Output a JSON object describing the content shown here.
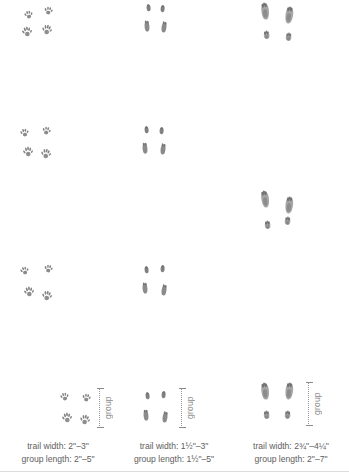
{
  "page": {
    "background_color": "#ffffff",
    "text_color": "#5e5e60",
    "print_color": "#6e6e70"
  },
  "columns": [
    {
      "id": "squirrel",
      "group_label": "group",
      "caption": {
        "trail_width": "trail width: 2\"–3\"",
        "group_length": "group length: 2\"–5\""
      },
      "groups": [
        {
          "prints": [
            {
              "x": 24,
              "y": 10,
              "kind": "small-front",
              "rot": -12,
              "scale": 1.0
            },
            {
              "x": 44,
              "y": 6,
              "kind": "small-front",
              "rot": 10,
              "scale": 1.0
            },
            {
              "x": 22,
              "y": 26,
              "kind": "small-hind",
              "rot": -8,
              "scale": 1.0
            },
            {
              "x": 42,
              "y": 24,
              "kind": "small-hind",
              "rot": 8,
              "scale": 1.0
            }
          ]
        },
        {
          "prints": [
            {
              "x": 20,
              "y": 128,
              "kind": "small-front",
              "rot": -10,
              "scale": 1.0
            },
            {
              "x": 42,
              "y": 126,
              "kind": "small-front",
              "rot": 12,
              "scale": 1.0
            },
            {
              "x": 23,
              "y": 146,
              "kind": "small-hind",
              "rot": -6,
              "scale": 1.0
            },
            {
              "x": 41,
              "y": 148,
              "kind": "small-hind",
              "rot": 6,
              "scale": 1.0
            }
          ]
        },
        {
          "prints": [
            {
              "x": 20,
              "y": 266,
              "kind": "small-front",
              "rot": -14,
              "scale": 1.0
            },
            {
              "x": 44,
              "y": 264,
              "kind": "small-front",
              "rot": 10,
              "scale": 1.0
            },
            {
              "x": 24,
              "y": 286,
              "kind": "small-hind",
              "rot": -8,
              "scale": 1.0
            },
            {
              "x": 42,
              "y": 290,
              "kind": "small-hind",
              "rot": 6,
              "scale": 1.0
            }
          ]
        },
        {
          "prints": [
            {
              "x": 60,
              "y": 392,
              "kind": "small-front",
              "rot": -12,
              "scale": 1.0
            },
            {
              "x": 82,
              "y": 393,
              "kind": "small-front",
              "rot": 10,
              "scale": 1.0
            },
            {
              "x": 62,
              "y": 412,
              "kind": "small-hind",
              "rot": -8,
              "scale": 1.0
            },
            {
              "x": 80,
              "y": 414,
              "kind": "small-hind",
              "rot": 8,
              "scale": 1.0
            }
          ]
        }
      ],
      "marker": {
        "x": 96,
        "y": 388,
        "height": 40
      }
    },
    {
      "id": "mouse",
      "group_label": "group",
      "caption": {
        "trail_width": "trail width: 1½\"–3\"",
        "group_length": "group length: 1½\"–5\""
      },
      "groups": [
        {
          "prints": [
            {
              "x": 30,
              "y": 4,
              "kind": "narrow-front",
              "rot": -6,
              "scale": 1.0
            },
            {
              "x": 44,
              "y": 5,
              "kind": "narrow-front",
              "rot": 6,
              "scale": 1.0
            },
            {
              "x": 28,
              "y": 20,
              "kind": "narrow-hind",
              "rot": -4,
              "scale": 1.0
            },
            {
              "x": 45,
              "y": 21,
              "kind": "narrow-hind",
              "rot": 8,
              "scale": 1.0
            }
          ]
        },
        {
          "prints": [
            {
              "x": 28,
              "y": 126,
              "kind": "narrow-front",
              "rot": -5,
              "scale": 1.0
            },
            {
              "x": 43,
              "y": 127,
              "kind": "narrow-front",
              "rot": 5,
              "scale": 1.0
            },
            {
              "x": 26,
              "y": 142,
              "kind": "narrow-hind",
              "rot": -5,
              "scale": 1.0
            },
            {
              "x": 44,
              "y": 143,
              "kind": "narrow-hind",
              "rot": 7,
              "scale": 1.0
            }
          ]
        },
        {
          "prints": [
            {
              "x": 28,
              "y": 266,
              "kind": "narrow-front",
              "rot": -6,
              "scale": 1.0
            },
            {
              "x": 44,
              "y": 265,
              "kind": "narrow-front",
              "rot": 6,
              "scale": 1.0
            },
            {
              "x": 26,
              "y": 282,
              "kind": "narrow-hind",
              "rot": -4,
              "scale": 1.0
            },
            {
              "x": 45,
              "y": 284,
              "kind": "narrow-hind",
              "rot": 8,
              "scale": 1.0
            }
          ]
        },
        {
          "prints": [
            {
              "x": 29,
              "y": 392,
              "kind": "narrow-front",
              "rot": -6,
              "scale": 1.0
            },
            {
              "x": 45,
              "y": 391,
              "kind": "narrow-front",
              "rot": 6,
              "scale": 1.0
            },
            {
              "x": 27,
              "y": 409,
              "kind": "narrow-hind",
              "rot": -5,
              "scale": 1.0
            },
            {
              "x": 46,
              "y": 411,
              "kind": "narrow-hind",
              "rot": 8,
              "scale": 1.0
            }
          ]
        }
      ],
      "marker": {
        "x": 62,
        "y": 388,
        "height": 40
      }
    },
    {
      "id": "rabbit",
      "group_label": "group",
      "caption": {
        "trail_width": "trail width: 2¾\"–4¼\"",
        "group_length": "group length: 2\"–7\""
      },
      "groups": [
        {
          "prints": [
            {
              "x": 28,
              "y": 2,
              "kind": "long-hind",
              "rot": -6,
              "scale": 1.0
            },
            {
              "x": 52,
              "y": 6,
              "kind": "long-hind",
              "rot": 8,
              "scale": 1.0
            },
            {
              "x": 30,
              "y": 30,
              "kind": "round-front",
              "rot": -4,
              "scale": 1.0
            },
            {
              "x": 52,
              "y": 32,
              "kind": "round-front",
              "rot": 6,
              "scale": 1.0
            }
          ]
        },
        {
          "prints": [
            {
              "x": 28,
              "y": 190,
              "kind": "long-hind",
              "rot": -8,
              "scale": 1.0
            },
            {
              "x": 52,
              "y": 196,
              "kind": "long-hind",
              "rot": 6,
              "scale": 1.0
            },
            {
              "x": 31,
              "y": 220,
              "kind": "round-front",
              "rot": -4,
              "scale": 1.0
            },
            {
              "x": 51,
              "y": 216,
              "kind": "round-front",
              "rot": 6,
              "scale": 1.0
            }
          ]
        },
        {
          "prints": [
            {
              "x": 28,
              "y": 382,
              "kind": "long-hind",
              "rot": -6,
              "scale": 1.0
            },
            {
              "x": 52,
              "y": 382,
              "kind": "long-hind",
              "rot": 6,
              "scale": 1.0
            },
            {
              "x": 30,
              "y": 410,
              "kind": "round-front",
              "rot": -4,
              "scale": 1.0
            },
            {
              "x": 51,
              "y": 410,
              "kind": "round-front",
              "rot": 5,
              "scale": 1.0
            }
          ]
        }
      ],
      "marker": {
        "x": 72,
        "y": 382,
        "height": 44
      }
    }
  ]
}
